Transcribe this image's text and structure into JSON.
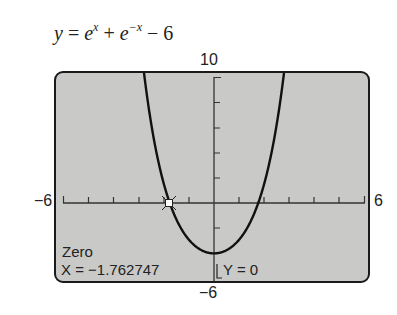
{
  "equation": {
    "y": "y",
    "eq": " = ",
    "e1": "e",
    "sup1": "x",
    "plus": " + ",
    "e2": "e",
    "sup2": "−x",
    "minus": " − 6"
  },
  "window": {
    "ymax_label": "10",
    "ymin_label": "−6",
    "xmin_label": "−6",
    "xmax_label": "6"
  },
  "readout": {
    "mode": "Zero",
    "x_label": "X = −1.762747",
    "y_label": "Y = 0"
  },
  "colors": {
    "screen_bg": "#c9c9c7",
    "curve": "#111111",
    "axis": "#333333"
  },
  "chart_data": {
    "type": "line",
    "function": "e^x + e^-x - 6",
    "xlim": [
      -6,
      6
    ],
    "ylim": [
      -6,
      10
    ],
    "xscl": 1,
    "yscl": 2,
    "grid": false,
    "x": [
      -2.84,
      -2.5,
      -2.0,
      -1.762747,
      -1.5,
      -1.0,
      -0.5,
      0,
      0.5,
      1.0,
      1.5,
      1.762747,
      2.0,
      2.5,
      2.84
    ],
    "y": [
      11.2,
      6.26,
      1.52,
      0.0,
      -1.3,
      -2.91,
      -3.74,
      -4.0,
      -3.74,
      -2.91,
      -1.3,
      0.0,
      1.52,
      6.26,
      11.2
    ],
    "annotations": [
      {
        "type": "zero",
        "x": -1.762747,
        "y": 0,
        "label": "Zero"
      }
    ],
    "tick_labels": {
      "xmin": "-6",
      "xmax": "6",
      "ymin": "-6",
      "ymax": "10"
    }
  }
}
